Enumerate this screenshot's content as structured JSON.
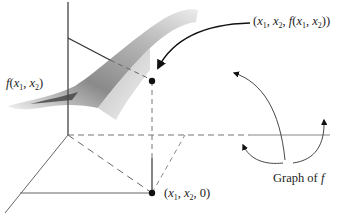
{
  "labels": {
    "surface_point": "(x1, x2, f(x1, x2))",
    "surface_height": "f(x1, x2)",
    "base_point": "(x1, x2, 0)",
    "graph_caption": "Graph of f"
  },
  "label_parts": {
    "surface_point": {
      "open": "(",
      "x": "x",
      "one": "1",
      "comma1": ", ",
      "x2": "x",
      "two": "2",
      "comma2": ", ",
      "f": "f",
      "paren": "(",
      "x3": "x",
      "one2": "1",
      "comma3": ", ",
      "x4": "x",
      "two2": "2",
      "close": "))"
    },
    "surface_height": {
      "f": "f",
      "open": "(",
      "x": "x",
      "one": "1",
      "comma": ", ",
      "x2": "x",
      "two": "2",
      "close": ")"
    },
    "base_point": {
      "open": "(",
      "x": "x",
      "one": "1",
      "comma1": ", ",
      "x2": "x",
      "two": "2",
      "rest": ", 0)"
    },
    "graph_caption": {
      "text": "Graph of ",
      "f": "f"
    }
  },
  "colors": {
    "axis": "#555555",
    "surface_dark": "#6e6e6e",
    "surface_mid": "#a8a8a8",
    "surface_light": "#dcdcdc",
    "point": "#111111"
  }
}
